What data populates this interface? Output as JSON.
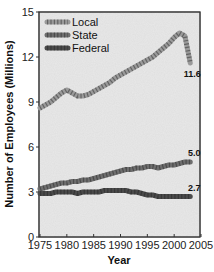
{
  "chart_data": {
    "type": "line",
    "title": "",
    "xlabel": "Year",
    "ylabel": "Number of Employees (Millions)",
    "xlim": [
      1975,
      2005
    ],
    "ylim": [
      0,
      15
    ],
    "xticks": [
      1975,
      1980,
      1985,
      1990,
      1995,
      2000,
      2005
    ],
    "yticks": [
      0,
      3,
      6,
      9,
      12,
      15
    ],
    "grid": false,
    "legend_position": "upper left",
    "x": [
      1975,
      1976,
      1977,
      1978,
      1979,
      1980,
      1981,
      1982,
      1983,
      1984,
      1985,
      1986,
      1987,
      1988,
      1989,
      1990,
      1991,
      1992,
      1993,
      1994,
      1995,
      1996,
      1997,
      1998,
      1999,
      2000,
      2001,
      2002,
      2003
    ],
    "series": [
      {
        "name": "Local",
        "color": "#9a9a9a",
        "values": [
          8.6,
          8.8,
          9.0,
          9.3,
          9.6,
          9.8,
          9.6,
          9.4,
          9.4,
          9.5,
          9.7,
          9.9,
          10.1,
          10.3,
          10.6,
          10.8,
          11.0,
          11.2,
          11.4,
          11.6,
          11.8,
          12.0,
          12.3,
          12.6,
          12.9,
          13.3,
          13.6,
          13.4,
          11.6
        ],
        "end_label": "11.6"
      },
      {
        "name": "State",
        "color": "#6e6e6e",
        "values": [
          3.2,
          3.3,
          3.4,
          3.5,
          3.6,
          3.6,
          3.7,
          3.7,
          3.8,
          3.8,
          3.9,
          4.0,
          4.1,
          4.2,
          4.3,
          4.4,
          4.5,
          4.5,
          4.6,
          4.6,
          4.7,
          4.7,
          4.6,
          4.7,
          4.8,
          4.8,
          4.9,
          5.0,
          5.0
        ],
        "end_label": "5.0"
      },
      {
        "name": "Federal",
        "color": "#4a4a4a",
        "values": [
          2.9,
          2.9,
          2.9,
          3.0,
          3.0,
          3.0,
          3.0,
          2.9,
          3.0,
          3.0,
          3.0,
          3.0,
          3.1,
          3.1,
          3.1,
          3.1,
          3.1,
          3.0,
          3.0,
          2.9,
          2.8,
          2.8,
          2.7,
          2.7,
          2.7,
          2.7,
          2.7,
          2.7,
          2.7
        ],
        "end_label": "2.7"
      }
    ]
  },
  "labels": {
    "xlabel": "Year",
    "ylabel": "Number of Employees (Millions)"
  }
}
